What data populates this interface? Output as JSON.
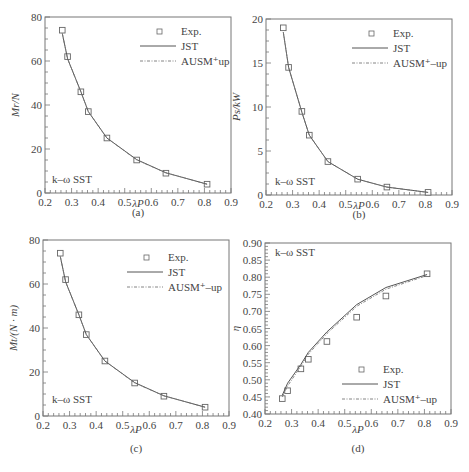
{
  "figure": {
    "panels": [
      "(a)",
      "(b)",
      "(c)",
      "(d)"
    ]
  },
  "legend": {
    "exp": "Exp.",
    "jst": "JST",
    "ausm_a": "AUSM⁺up",
    "ausm": "AUSM⁺–up"
  },
  "model_label": "k–ω SST",
  "chart_data": [
    {
      "type": "line",
      "panel": "(a)",
      "xlabel": "λP",
      "ylabel": "Mr/N",
      "xlim": [
        0.2,
        0.9
      ],
      "ylim": [
        0,
        80
      ],
      "xticks": [
        "0.2",
        "0.3",
        "0.4",
        "0.5",
        "0.6",
        "0.7",
        "0.8",
        "0.9"
      ],
      "yticks": [
        "0",
        "20",
        "40",
        "60",
        "80"
      ],
      "annotation": "k–ω SST",
      "legend": [
        "Exp.",
        "JST",
        "AUSM⁺up"
      ],
      "legend_position": "upper right",
      "grid": false,
      "series": [
        {
          "name": "Exp.",
          "marker": "square",
          "x": [
            0.265,
            0.285,
            0.335,
            0.363,
            0.433,
            0.545,
            0.655,
            0.81
          ],
          "y": [
            74,
            62,
            46,
            37,
            25,
            15,
            9,
            4
          ]
        },
        {
          "name": "JST",
          "style": "solid",
          "x": [
            0.265,
            0.285,
            0.335,
            0.363,
            0.433,
            0.545,
            0.655,
            0.81
          ],
          "y": [
            72.5,
            61,
            46,
            37,
            25,
            15.2,
            9.2,
            4
          ]
        },
        {
          "name": "AUSM⁺up",
          "style": "dashdot",
          "x": [
            0.265,
            0.285,
            0.335,
            0.363,
            0.433,
            0.545,
            0.655,
            0.81
          ],
          "y": [
            72.5,
            61,
            46,
            37,
            25,
            15,
            9.2,
            4
          ]
        }
      ]
    },
    {
      "type": "line",
      "panel": "(b)",
      "xlabel": "λP",
      "ylabel": "Ps/kW",
      "xlim": [
        0.2,
        0.9
      ],
      "ylim": [
        0,
        20
      ],
      "xticks": [
        "0.2",
        "0.3",
        "0.4",
        "0.5",
        "0.6",
        "0.7",
        "0.8",
        "0.9"
      ],
      "yticks": [
        "0",
        "5",
        "10",
        "15",
        "20"
      ],
      "annotation": "k–ω SST",
      "legend": [
        "Exp.",
        "JST",
        "AUSM⁺–up"
      ],
      "legend_position": "upper right",
      "grid": false,
      "series": [
        {
          "name": "Exp.",
          "marker": "square",
          "x": [
            0.265,
            0.285,
            0.335,
            0.363,
            0.433,
            0.545,
            0.655,
            0.81
          ],
          "y": [
            19,
            14.5,
            9.5,
            6.8,
            3.8,
            1.8,
            0.9,
            0.3
          ]
        },
        {
          "name": "JST",
          "style": "solid",
          "x": [
            0.265,
            0.285,
            0.335,
            0.363,
            0.433,
            0.545,
            0.655,
            0.81
          ],
          "y": [
            18.5,
            14.5,
            9.4,
            6.8,
            3.8,
            1.8,
            0.9,
            0.3
          ]
        },
        {
          "name": "AUSM⁺–up",
          "style": "dashdot",
          "x": [
            0.265,
            0.285,
            0.335,
            0.363,
            0.433,
            0.545,
            0.655,
            0.81
          ],
          "y": [
            18.5,
            14.5,
            9.4,
            6.8,
            3.8,
            1.8,
            0.9,
            0.3
          ]
        }
      ]
    },
    {
      "type": "line",
      "panel": "(c)",
      "xlabel": "λP",
      "ylabel": "Mt/(N · m)",
      "xlim": [
        0.2,
        0.9
      ],
      "ylim": [
        0,
        80
      ],
      "xticks": [
        "0.2",
        "0.3",
        "0.4",
        "0.5",
        "0.6",
        "0.7",
        "0.8",
        "0.9"
      ],
      "yticks": [
        "0",
        "20",
        "40",
        "60",
        "80"
      ],
      "annotation": "k–ω SST",
      "legend": [
        "Exp.",
        "JST",
        "AUSM⁺–up"
      ],
      "legend_position": "upper right",
      "grid": false,
      "series": [
        {
          "name": "Exp.",
          "marker": "square",
          "x": [
            0.265,
            0.285,
            0.335,
            0.363,
            0.433,
            0.545,
            0.655,
            0.81
          ],
          "y": [
            74,
            62,
            46,
            37,
            25,
            15,
            9,
            4
          ]
        },
        {
          "name": "JST",
          "style": "solid",
          "x": [
            0.265,
            0.285,
            0.335,
            0.363,
            0.433,
            0.545,
            0.655,
            0.81
          ],
          "y": [
            72.5,
            61,
            46,
            37,
            25,
            15.2,
            9.2,
            4
          ]
        },
        {
          "name": "AUSM⁺–up",
          "style": "dashdot",
          "x": [
            0.265,
            0.285,
            0.335,
            0.363,
            0.433,
            0.545,
            0.655,
            0.81
          ],
          "y": [
            72.5,
            61,
            46,
            37,
            25,
            15,
            9.2,
            4
          ]
        }
      ]
    },
    {
      "type": "line",
      "panel": "(d)",
      "xlabel": "λP",
      "ylabel": "η",
      "xlim": [
        0.2,
        0.9
      ],
      "ylim": [
        0.4,
        0.9
      ],
      "xticks": [
        "0.2",
        "0.3",
        "0.4",
        "0.5",
        "0.6",
        "0.7",
        "0.8",
        "0.9"
      ],
      "yticks": [
        "0.40",
        "0.45",
        "0.50",
        "0.55",
        "0.60",
        "0.65",
        "0.70",
        "0.75",
        "0.80",
        "0.85",
        "0.90"
      ],
      "annotation": "k–ω SST",
      "legend": [
        "Exp.",
        "JST",
        "AUSM⁺–up"
      ],
      "legend_position": "lower right",
      "grid": false,
      "series": [
        {
          "name": "Exp.",
          "marker": "square",
          "x": [
            0.265,
            0.285,
            0.335,
            0.363,
            0.433,
            0.545,
            0.655,
            0.81
          ],
          "y": [
            0.445,
            0.468,
            0.532,
            0.56,
            0.612,
            0.683,
            0.745,
            0.81
          ]
        },
        {
          "name": "JST",
          "style": "solid",
          "x": [
            0.265,
            0.285,
            0.335,
            0.363,
            0.433,
            0.545,
            0.655,
            0.81
          ],
          "y": [
            0.455,
            0.49,
            0.545,
            0.58,
            0.64,
            0.72,
            0.77,
            0.808
          ]
        },
        {
          "name": "AUSM⁺–up",
          "style": "dashdot",
          "x": [
            0.265,
            0.285,
            0.335,
            0.363,
            0.433,
            0.545,
            0.655,
            0.81
          ],
          "y": [
            0.45,
            0.482,
            0.54,
            0.575,
            0.635,
            0.715,
            0.765,
            0.805
          ]
        }
      ]
    }
  ]
}
